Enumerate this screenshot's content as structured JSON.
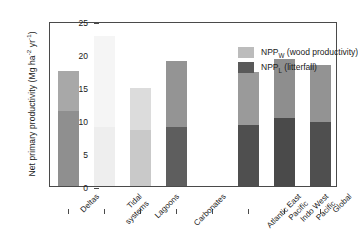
{
  "chart_data": {
    "type": "bar",
    "stacked": true,
    "title": "",
    "xlabel": "",
    "ylabel": "Net primary productivity (Mg ha⁻² yr⁻¹)",
    "ylabel_main": "Net primary productivity (Mg ha",
    "ylabel_sup1": "-2",
    "ylabel_mid": " yr",
    "ylabel_sup2": "-1",
    "ylabel_end": ")",
    "ylim": [
      0,
      25
    ],
    "yticks": [
      0,
      5,
      10,
      15,
      20,
      25
    ],
    "ytick_labels": [
      "0",
      "5",
      "10",
      "15",
      "20",
      "25"
    ],
    "grid": false,
    "legend_position": "top-right",
    "categories": [
      "Deltas",
      "Tidal systems",
      "Lagoons",
      "Carbonates",
      "",
      "Atlantic East Pacific",
      "Indo West Pacific",
      "Global"
    ],
    "category_lines": [
      [
        "Deltas"
      ],
      [
        "Tidal",
        "systems"
      ],
      [
        "Lagoons"
      ],
      [
        "Carbonates"
      ],
      [
        ""
      ],
      [
        "Atlantic East",
        "Pacific"
      ],
      [
        "Indo West",
        "Pacific"
      ],
      [
        "Global"
      ]
    ],
    "series": [
      {
        "name": "NPP_L (litterfall)",
        "label_main": "NPP",
        "label_sub": "L",
        "label_rest": " (litterfall)",
        "values": [
          11.3,
          9.0,
          8.5,
          8.9,
          null,
          9.2,
          10.3,
          9.7
        ],
        "colors": [
          "#8f8f8f",
          "#eeeeee",
          "#c9c9c9",
          "#5e5e5e",
          null,
          "#4f4f4f",
          "#4a4a4a",
          "#4f4f4f"
        ]
      },
      {
        "name": "NPP_W (wood productivity)",
        "label_main": "NPP",
        "label_sub": "W",
        "label_rest": " (wood productivity)",
        "values": [
          6.2,
          13.8,
          6.3,
          10.1,
          null,
          8.0,
          8.9,
          8.6
        ],
        "colors": [
          "#a8a8a8",
          "#f5f5f5",
          "#dcdcdc",
          "#949494",
          null,
          "#9a9a9a",
          "#8e8e8e",
          "#939393"
        ]
      }
    ],
    "totals": [
      17.5,
      22.8,
      14.8,
      19.0,
      null,
      17.2,
      19.2,
      18.3
    ],
    "legend": [
      {
        "label_main": "NPP",
        "label_sub": "W",
        "label_rest": " (wood productivity)",
        "color": "#bcbcbc"
      },
      {
        "label_main": "NPP",
        "label_sub": "L",
        "label_rest": " (litterfall)",
        "color": "#5a5a5a"
      }
    ],
    "axis_color": "#4a4a4a",
    "text_color": "#1a1a1a"
  }
}
